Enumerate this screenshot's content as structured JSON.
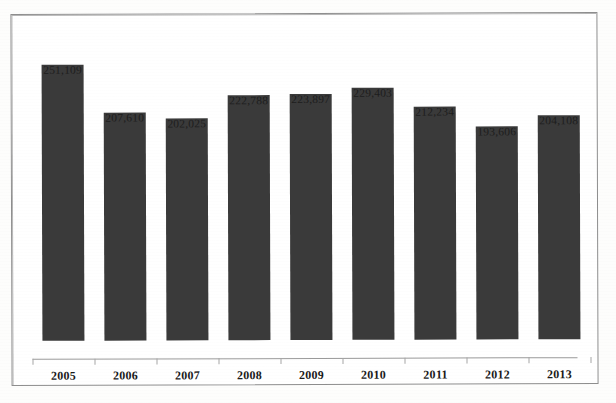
{
  "chart_data": {
    "type": "bar",
    "title": "",
    "subtitle": "",
    "xlabel": "",
    "ylabel": "",
    "grid": false,
    "legend": false,
    "axis_line": true,
    "ylim": [
      0,
      251109
    ],
    "categories": [
      "2005",
      "2006",
      "2007",
      "2008",
      "2009",
      "2010",
      "2011",
      "2012",
      "2013"
    ],
    "values": [
      251109,
      207610,
      202025,
      222788,
      223897,
      229403,
      212234,
      193606,
      204108
    ],
    "value_labels": [
      "251,109",
      "207,610",
      "202,025",
      "222,788",
      "223,897",
      "229,403",
      "212,234",
      "193,606",
      "204,108"
    ],
    "bar_color": "#3a3a3a",
    "background_color": "#ffffff",
    "border_color": "#8e8e8e"
  },
  "bars": [
    {
      "year": "2005",
      "label": "251,109",
      "value": 251109
    },
    {
      "year": "2006",
      "label": "207,610",
      "value": 207610
    },
    {
      "year": "2007",
      "label": "202,025",
      "value": 202025
    },
    {
      "year": "2008",
      "label": "222,788",
      "value": 222788
    },
    {
      "year": "2009",
      "label": "223,897",
      "value": 223897
    },
    {
      "year": "2010",
      "label": "229,403",
      "value": 229403
    },
    {
      "year": "2011",
      "label": "212,234",
      "value": 212234
    },
    {
      "year": "2012",
      "label": "193,606",
      "value": 193606
    },
    {
      "year": "2013",
      "label": "204,108",
      "value": 204108
    }
  ]
}
